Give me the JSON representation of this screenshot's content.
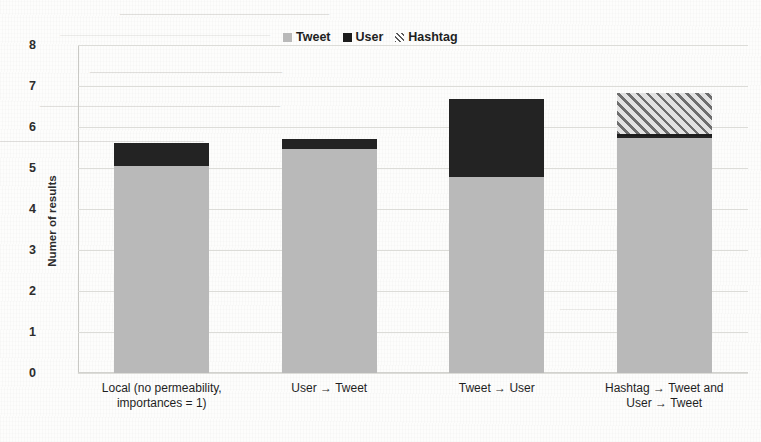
{
  "chart_data": {
    "type": "bar",
    "stacked": true,
    "title": "",
    "xlabel": "",
    "ylabel": "Numer of results",
    "ylim": [
      0,
      8
    ],
    "ytick_labels": [
      "0",
      "1",
      "2",
      "3",
      "4",
      "5",
      "6",
      "7",
      "8"
    ],
    "yticks": [
      0,
      1,
      2,
      3,
      4,
      5,
      6,
      7,
      8
    ],
    "grid": true,
    "legend_position": "top-center",
    "categories": [
      "Local (no permeability,\nimportances = 1)",
      "User → Tweet",
      "Tweet → User",
      "Hashtag → Tweet and\nUser → Tweet"
    ],
    "series": [
      {
        "name": "Tweet",
        "color": "#b9b9b9",
        "values": [
          5.05,
          5.47,
          4.78,
          5.72
        ]
      },
      {
        "name": "User",
        "color": "#232323",
        "values": [
          0.55,
          0.23,
          1.9,
          0.05
        ]
      },
      {
        "name": "Hashtag",
        "color": "#c6c6c6",
        "pattern": "diagonal-hatch",
        "values": [
          0,
          0,
          0,
          1.05
        ]
      }
    ],
    "totals": [
      5.6,
      5.7,
      6.68,
      6.82
    ]
  },
  "legend": {
    "items": [
      {
        "label": "Tweet",
        "swatch": "tweet-swatch"
      },
      {
        "label": "User",
        "swatch": "user-swatch"
      },
      {
        "label": "Hashtag",
        "swatch": "hashtag-swatch"
      }
    ]
  },
  "axes": {
    "y_title": "Numer of results",
    "y_ticks": [
      "8",
      "7",
      "6",
      "5",
      "4",
      "3",
      "2",
      "1",
      "0"
    ],
    "x_labels": [
      "Local (no permeability,\nimportances = 1)",
      "User → Tweet",
      "Tweet → User",
      "Hashtag → Tweet and\nUser → Tweet"
    ]
  },
  "background_artifacts": {
    "note": "scanned page with faint reversed bleed-through text",
    "marks": [
      "—",
      "—",
      "—",
      "—",
      "—",
      "—"
    ]
  }
}
